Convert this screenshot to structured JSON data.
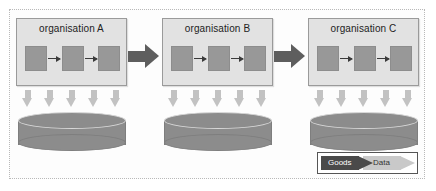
{
  "diagram": {
    "organisations": [
      {
        "id": "org-a",
        "label": "organisation A",
        "x": 16,
        "y": 18,
        "process_steps": [
          "step-1",
          "step-2",
          "step-3"
        ],
        "database": {
          "name": "database-a",
          "x": 18,
          "y": 112
        },
        "data_arrow_count": 5
      },
      {
        "id": "org-b",
        "label": "organisation B",
        "x": 162,
        "y": 18,
        "process_steps": [
          "step-1",
          "step-2",
          "step-3"
        ],
        "database": {
          "name": "database-b",
          "x": 164,
          "y": 112
        },
        "data_arrow_count": 5
      },
      {
        "id": "org-c",
        "label": "organisation C",
        "x": 308,
        "y": 18,
        "process_steps": [
          "step-1",
          "step-2",
          "step-3"
        ],
        "database": {
          "name": "database-c",
          "x": 310,
          "y": 112
        },
        "data_arrow_count": 5
      }
    ],
    "goods_arrows": [
      {
        "name": "goods-arrow-a-to-b",
        "x": 128
      },
      {
        "name": "goods-arrow-b-to-c",
        "x": 274
      }
    ],
    "legend": {
      "goods_label": "Goods",
      "data_label": "Data"
    },
    "colors": {
      "goods_arrow": "#5e5e5e",
      "legend_goods_arrow": "#4a4a4a",
      "data_arrow": "#c2c2c2",
      "legend_data_arrow": "#c9c9c9",
      "organisation_box": "#e2e2e2",
      "organisation_border": "#9a9a9a",
      "process_box": "#989898",
      "database": "#8c8c8c",
      "frame_border": "#b9b9b9",
      "background": "#ffffff"
    }
  }
}
